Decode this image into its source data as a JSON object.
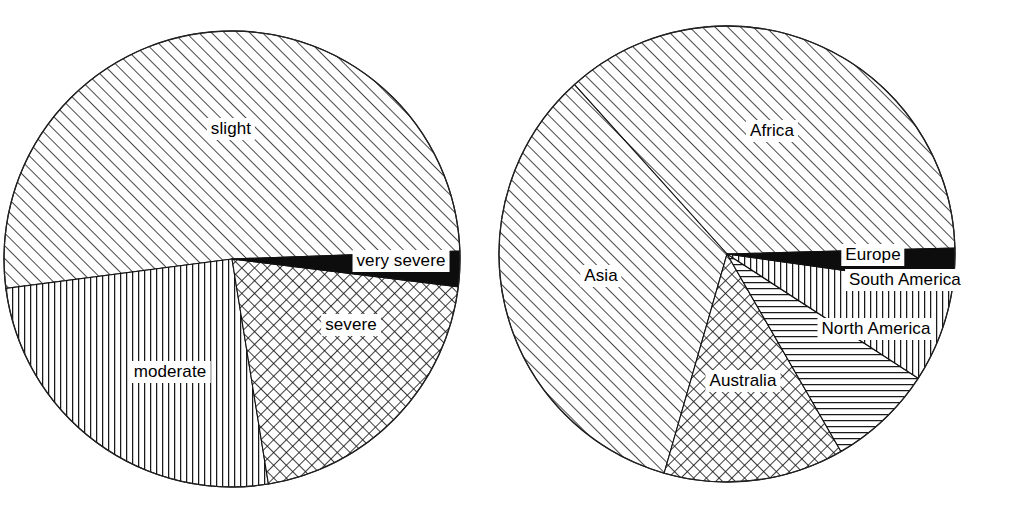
{
  "figure": {
    "background_color": "#ffffff",
    "ink_color": "#000000",
    "width": 1014,
    "height": 506
  },
  "chart_data": [
    {
      "type": "pie",
      "name": "severity-pie",
      "title": "",
      "legend": "none",
      "labels_inline": true,
      "center": {
        "x": 232,
        "y": 259
      },
      "radius": 228,
      "categories": [
        "slight",
        "moderate",
        "severe",
        "very severe"
      ],
      "values": [
        51.5,
        25.5,
        20.5,
        1.0
      ],
      "unit": "%",
      "slices": [
        {
          "label": "slight",
          "value": 51.5,
          "fill": "diagonal-hatch-up",
          "start_angle_deg": 2.0,
          "end_angle_deg": 187.4,
          "label_x": 231,
          "label_y": 129
        },
        {
          "label": "moderate",
          "value": 25.5,
          "fill": "vertical-lines",
          "start_angle_deg": 187.4,
          "end_angle_deg": 279.2,
          "label_x": 170,
          "label_y": 372
        },
        {
          "label": "severe",
          "value": 20.5,
          "fill": "cross-hatch",
          "start_angle_deg": 279.2,
          "end_angle_deg": 353.0,
          "label_x": 351,
          "label_y": 325
        },
        {
          "label": "very severe",
          "value": 1.0,
          "fill": "solid-black",
          "start_angle_deg": 353.0,
          "end_angle_deg": 362.0,
          "label_x": 401,
          "label_y": 261
        }
      ]
    },
    {
      "type": "pie",
      "name": "continent-pie",
      "title": "",
      "legend": "none",
      "labels_inline": true,
      "center": {
        "x": 727,
        "y": 254
      },
      "radius": 228,
      "categories": [
        "Africa",
        "Asia",
        "Australia",
        "North America",
        "South America",
        "Europe"
      ],
      "values": [
        36.5,
        38.5,
        12.5,
        7.5,
        4.0,
        1.0
      ],
      "unit": "%",
      "slices": [
        {
          "label": "Africa",
          "value": 36.5,
          "fill": "diagonal-hatch-up",
          "start_angle_deg": 1.5,
          "end_angle_deg": 132.0,
          "label_x": 772,
          "label_y": 131
        },
        {
          "label": "Asia",
          "value": 38.5,
          "fill": "diagonal-hatch-up",
          "start_angle_deg": 132.0,
          "end_angle_deg": 254.0,
          "label_x": 601,
          "label_y": 276
        },
        {
          "label": "Australia",
          "value": 12.5,
          "fill": "cross-hatch",
          "start_angle_deg": 254.0,
          "end_angle_deg": 300.0,
          "label_x": 743,
          "label_y": 381
        },
        {
          "label": "North America",
          "value": 7.5,
          "fill": "horizontal-lines",
          "start_angle_deg": 300.0,
          "end_angle_deg": 327.0,
          "label_x": 876,
          "label_y": 329
        },
        {
          "label": "South America",
          "value": 4.0,
          "fill": "vertical-lines",
          "start_angle_deg": 327.0,
          "end_angle_deg": 352.0,
          "label_x": 905,
          "label_y": 280
        },
        {
          "label": "Europe",
          "value": 1.0,
          "fill": "solid-black",
          "start_angle_deg": 352.0,
          "end_angle_deg": 361.5,
          "label_x": 873,
          "label_y": 255
        }
      ]
    }
  ]
}
